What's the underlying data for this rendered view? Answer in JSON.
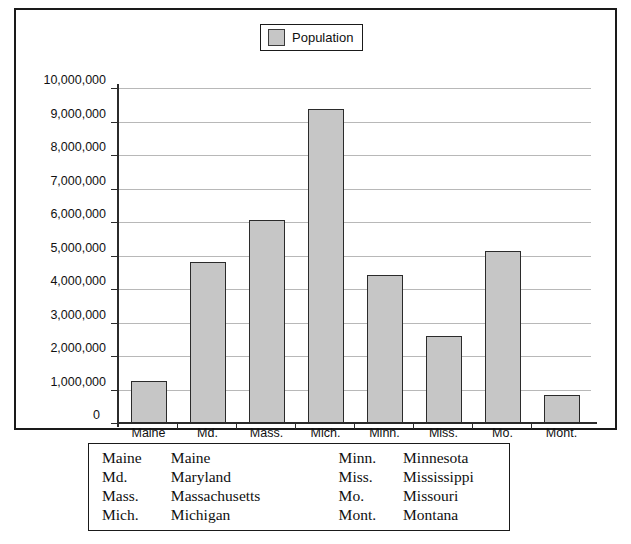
{
  "chart_data": {
    "type": "bar",
    "title": "",
    "xlabel": "",
    "ylabel": "",
    "ylim": [
      0,
      10000000
    ],
    "grid": true,
    "legend_position": "top-center",
    "series": [
      {
        "name": "Population",
        "values": [
          1240000,
          4810000,
          6050000,
          9360000,
          4430000,
          2610000,
          5120000,
          840000
        ]
      }
    ],
    "categories": [
      "Maine",
      "Md.",
      "Mass.",
      "Mich.",
      "Minn.",
      "Miss.",
      "Mo.",
      "Mont."
    ],
    "ytick_labels": [
      "10,000,000",
      "9,000,000",
      "8,000,000",
      "7,000,000",
      "6,000,000",
      "5,000,000",
      "4,000,000",
      "3,000,000",
      "2,000,000",
      "1,000,000",
      "0"
    ],
    "ytick_values": [
      10000000,
      9000000,
      8000000,
      7000000,
      6000000,
      5000000,
      4000000,
      3000000,
      2000000,
      1000000,
      0
    ],
    "colors": {
      "bar_fill": "#c6c6c6",
      "bar_border": "#2b2b2b",
      "gridline": "#b8b8b8",
      "axis": "#2b2b2b",
      "frame": "#1a1a1a",
      "text": "#111111"
    }
  },
  "legend": {
    "label": "Population",
    "swatch_color": "#c6c6c6"
  },
  "axis": {
    "zero_label": "0"
  },
  "abbrev_table": {
    "rows": [
      {
        "abbr_left": "Maine",
        "name_left": "Maine",
        "abbr_right": "Minn.",
        "name_right": "Minnesota"
      },
      {
        "abbr_left": "Md.",
        "name_left": "Maryland",
        "abbr_right": "Miss.",
        "name_right": "Mississippi"
      },
      {
        "abbr_left": "Mass.",
        "name_left": "Massachusetts",
        "abbr_right": "Mo.",
        "name_right": "Missouri"
      },
      {
        "abbr_left": "Mich.",
        "name_left": "Michigan",
        "abbr_right": "Mont.",
        "name_right": "Montana"
      }
    ]
  }
}
